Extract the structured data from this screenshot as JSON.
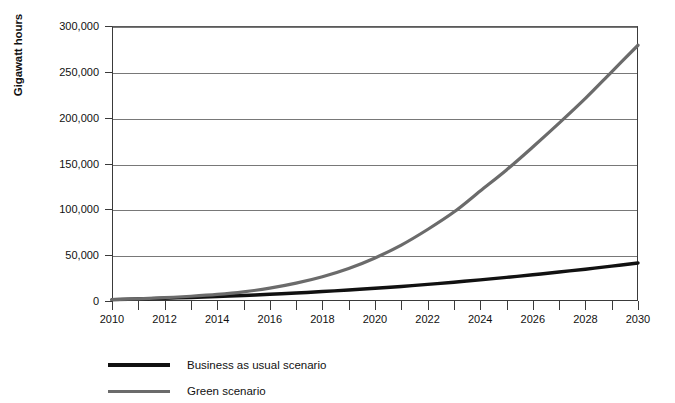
{
  "chart_data": {
    "type": "line",
    "title": "",
    "xlabel": "",
    "ylabel": "Gigawatt hours",
    "xlim": [
      2010,
      2030
    ],
    "ylim": [
      0,
      300000
    ],
    "grid": true,
    "legend_position": "bottom-left",
    "y_ticks": [
      0,
      50000,
      100000,
      150000,
      200000,
      250000,
      300000
    ],
    "y_tick_labels": [
      "0",
      "50,000",
      "100,000",
      "150,000",
      "200,000",
      "250,000",
      "300,000"
    ],
    "x_ticks": [
      2010,
      2011,
      2012,
      2013,
      2014,
      2015,
      2016,
      2017,
      2018,
      2019,
      2020,
      2021,
      2022,
      2023,
      2024,
      2025,
      2026,
      2027,
      2028,
      2029,
      2030
    ],
    "x_tick_labels": [
      "2010",
      "",
      "2012",
      "",
      "2014",
      "",
      "2016",
      "",
      "2018",
      "",
      "2020",
      "",
      "2022",
      "",
      "2024",
      "",
      "2026",
      "",
      "2028",
      "",
      "2030"
    ],
    "x": [
      2010,
      2011,
      2012,
      2013,
      2014,
      2015,
      2016,
      2017,
      2018,
      2019,
      2020,
      2021,
      2022,
      2023,
      2024,
      2025,
      2026,
      2027,
      2028,
      2029,
      2030
    ],
    "series": [
      {
        "name": "Business as usual scenario",
        "color": "#111111",
        "width": 3.4,
        "values": [
          1500,
          2200,
          3000,
          3900,
          4900,
          6000,
          7300,
          8700,
          10300,
          12000,
          13900,
          15900,
          18100,
          20500,
          23100,
          25800,
          28600,
          31600,
          34700,
          38000,
          41500
        ]
      },
      {
        "name": "Green scenario",
        "color": "#6b6b6b",
        "width": 3.2,
        "values": [
          1500,
          2400,
          3600,
          5200,
          7200,
          10000,
          14000,
          19500,
          26500,
          35500,
          47000,
          61000,
          78000,
          97000,
          120000,
          143000,
          168000,
          194000,
          221000,
          250000,
          279000
        ]
      }
    ]
  },
  "legend": {
    "items": [
      {
        "label": "Business as usual scenario",
        "color": "#111111"
      },
      {
        "label": "Green scenario",
        "color": "#6b6b6b"
      }
    ]
  }
}
